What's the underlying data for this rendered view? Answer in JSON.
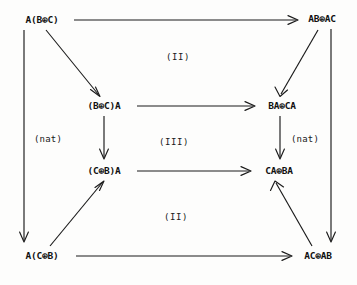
{
  "diagram": {
    "type": "commutative-diagram",
    "width": 357,
    "height": 285,
    "background_color": "#fdfdfc",
    "ink_color": "#1a1a1a",
    "nodes": [
      {
        "id": "n_tl",
        "label": "A(B⊕C)",
        "x": 42,
        "y": 20,
        "anchor": "outer-top-left"
      },
      {
        "id": "n_tr",
        "label": "AB⊕AC",
        "x": 322,
        "y": 19,
        "anchor": "outer-top-right"
      },
      {
        "id": "n_iul",
        "label": "(B⊕C)A",
        "x": 104,
        "y": 106,
        "anchor": "inner-upper-left"
      },
      {
        "id": "n_iur",
        "label": "BA⊕CA",
        "x": 282,
        "y": 106,
        "anchor": "inner-upper-right"
      },
      {
        "id": "n_ill",
        "label": "(C⊕B)A",
        "x": 104,
        "y": 171,
        "anchor": "inner-lower-left"
      },
      {
        "id": "n_ilr",
        "label": "CA⊕BA",
        "x": 279,
        "y": 171,
        "anchor": "inner-lower-right"
      },
      {
        "id": "n_bl",
        "label": "A(C⊕B)",
        "x": 42,
        "y": 256,
        "anchor": "outer-bottom-left"
      },
      {
        "id": "n_br",
        "label": "AC⊕AB",
        "x": 318,
        "y": 256,
        "anchor": "outer-bottom-right"
      }
    ],
    "edges": [
      {
        "id": "e_top",
        "from": "n_tl",
        "to": "n_tr",
        "kind": "horizontal",
        "direction": "right",
        "label": ""
      },
      {
        "id": "e_inner_up",
        "from": "n_iul",
        "to": "n_iur",
        "kind": "horizontal",
        "direction": "right",
        "label": ""
      },
      {
        "id": "e_inner_low",
        "from": "n_ill",
        "to": "n_ilr",
        "kind": "horizontal",
        "direction": "right",
        "label": ""
      },
      {
        "id": "e_bottom",
        "from": "n_bl",
        "to": "n_br",
        "kind": "horizontal",
        "direction": "right",
        "label": ""
      },
      {
        "id": "e_left_outer",
        "from": "n_tl",
        "to": "n_bl",
        "kind": "vertical",
        "direction": "down",
        "label": ""
      },
      {
        "id": "e_right_outer",
        "from": "n_tr",
        "to": "n_br",
        "kind": "vertical",
        "direction": "down",
        "label": ""
      },
      {
        "id": "e_left_inner",
        "from": "n_iul",
        "to": "n_ill",
        "kind": "vertical",
        "direction": "down",
        "label": "(nat)"
      },
      {
        "id": "e_right_inner",
        "from": "n_iur",
        "to": "n_ilr",
        "kind": "vertical",
        "direction": "down",
        "label": "(nat)"
      },
      {
        "id": "e_diag_tl",
        "from": "n_tl",
        "to": "n_iul",
        "kind": "diagonal",
        "direction": "down-right",
        "label": ""
      },
      {
        "id": "e_diag_tr",
        "from": "n_tr",
        "to": "n_iur",
        "kind": "diagonal",
        "direction": "down-left",
        "label": ""
      },
      {
        "id": "e_diag_bl",
        "from": "n_bl",
        "to": "n_ill",
        "kind": "diagonal",
        "direction": "up-right",
        "label": ""
      },
      {
        "id": "e_diag_br",
        "from": "n_br",
        "to": "n_ilr",
        "kind": "diagonal",
        "direction": "up-left",
        "label": ""
      }
    ],
    "edge_labels": [
      {
        "id": "lbl_nat_left",
        "text": "(nat)",
        "x": 48,
        "y": 139
      },
      {
        "id": "lbl_nat_right",
        "text": "(nat)",
        "x": 305,
        "y": 139
      }
    ],
    "region_labels": [
      {
        "id": "region_top",
        "text": "(II)",
        "x": 178,
        "y": 57
      },
      {
        "id": "region_middle",
        "text": "(III)",
        "x": 174,
        "y": 142
      },
      {
        "id": "region_bottom",
        "text": "(II)",
        "x": 176,
        "y": 217
      }
    ]
  }
}
